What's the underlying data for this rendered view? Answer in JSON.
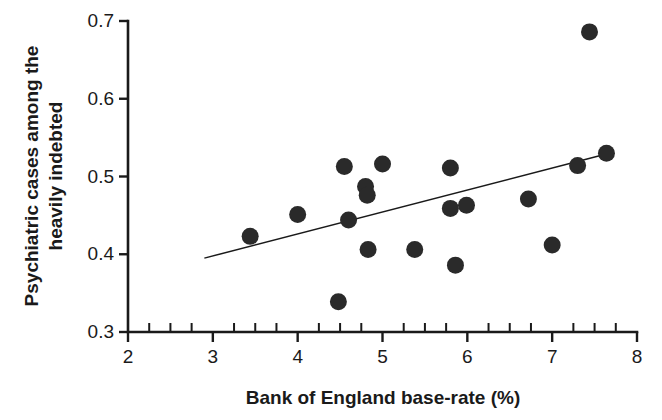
{
  "chart_data": {
    "type": "scatter",
    "title": "",
    "xlabel": "Bank of England base-rate (%)",
    "ylabel_line1": "Psychiatric cases among the",
    "ylabel_line2": "heavily indebted",
    "ylabel": "Psychiatric cases among the heavily indebted",
    "xlim": [
      2,
      8
    ],
    "ylim": [
      0.3,
      0.7
    ],
    "xticks": [
      2,
      3,
      4,
      5,
      6,
      7,
      8
    ],
    "xtick_labels": [
      "2",
      "3",
      "4",
      "5",
      "6",
      "7",
      "8"
    ],
    "yticks": [
      0.3,
      0.4,
      0.5,
      0.6,
      0.7
    ],
    "ytick_labels": [
      "0.3",
      "0.4",
      "0.5",
      "0.6",
      "0.7"
    ],
    "x_minor_tick_interval": 0.25,
    "y_minor_ticks": false,
    "grid": false,
    "legend": "none",
    "marker": "filled-circle",
    "marker_color": "#2a2a2a",
    "marker_radius_px": 8.5,
    "points": [
      {
        "x": 3.44,
        "y": 0.423
      },
      {
        "x": 4.0,
        "y": 0.451
      },
      {
        "x": 4.55,
        "y": 0.513
      },
      {
        "x": 4.48,
        "y": 0.339
      },
      {
        "x": 4.6,
        "y": 0.444
      },
      {
        "x": 4.8,
        "y": 0.487
      },
      {
        "x": 4.82,
        "y": 0.476
      },
      {
        "x": 4.83,
        "y": 0.406
      },
      {
        "x": 5.0,
        "y": 0.516
      },
      {
        "x": 5.38,
        "y": 0.406
      },
      {
        "x": 5.8,
        "y": 0.511
      },
      {
        "x": 5.8,
        "y": 0.459
      },
      {
        "x": 5.86,
        "y": 0.386
      },
      {
        "x": 5.99,
        "y": 0.463
      },
      {
        "x": 6.72,
        "y": 0.471
      },
      {
        "x": 7.0,
        "y": 0.412
      },
      {
        "x": 7.3,
        "y": 0.514
      },
      {
        "x": 7.44,
        "y": 0.686
      },
      {
        "x": 7.64,
        "y": 0.53
      }
    ],
    "trendline": {
      "x_start": 2.9,
      "y_start": 0.395,
      "x_end": 7.57,
      "y_end": 0.527,
      "color": "#1a1a1a"
    }
  },
  "colors": {
    "background": "#ffffff",
    "axis": "#1a1a1a",
    "marker": "#2a2a2a"
  }
}
